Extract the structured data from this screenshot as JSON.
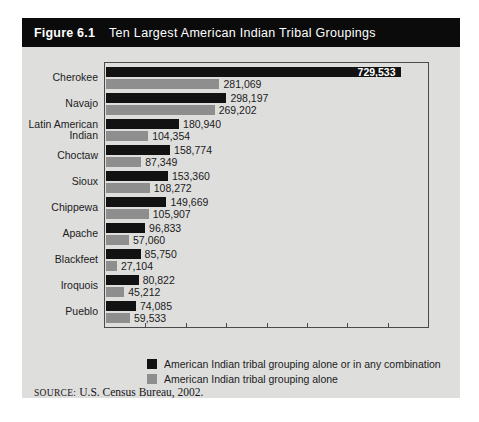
{
  "figure": {
    "number_label": "Figure 6.1",
    "title": "Ten Largest American Indian Tribal Groupings"
  },
  "source": {
    "prefix": "SOURCE:",
    "text": "U.S. Census Bureau, 2002."
  },
  "legend": {
    "position": "bottom",
    "items": [
      {
        "label": "American Indian tribal grouping alone or in any combination",
        "color": "#121212"
      },
      {
        "label": "American Indian tribal grouping alone",
        "color": "#8e8e8e"
      }
    ]
  },
  "colors": {
    "panel_background": "#dededd",
    "title_bar": "#0b0b0b",
    "series_combination": "#121212",
    "series_alone": "#8e8e8e",
    "axis": "#4a4a4a"
  },
  "chart_data": {
    "type": "bar",
    "orientation": "horizontal",
    "title": "Ten Largest American Indian Tribal Groupings",
    "xlabel": "",
    "ylabel": "",
    "xlim": [
      0,
      800000
    ],
    "grid": false,
    "legend_position": "bottom",
    "axis_ticks_labeled": false,
    "tick_count": 8,
    "categories": [
      "Cherokee",
      "Navajo",
      "Latin American\nIndian",
      "Choctaw",
      "Sioux",
      "Chippewa",
      "Apache",
      "Blackfeet",
      "Iroquois",
      "Pueblo"
    ],
    "series": [
      {
        "name": "American Indian tribal grouping alone or in any combination",
        "color": "#121212",
        "values": [
          729533,
          298197,
          180940,
          158774,
          153360,
          149669,
          96833,
          85750,
          80822,
          74085
        ],
        "value_labels": [
          "729,533",
          "298,197",
          "180,940",
          "158,774",
          "153,360",
          "149,669",
          "96,833",
          "85,750",
          "80,822",
          "74,085"
        ]
      },
      {
        "name": "American Indian tribal grouping alone",
        "color": "#8e8e8e",
        "values": [
          281069,
          269202,
          104354,
          87349,
          108272,
          105907,
          57060,
          27104,
          45212,
          59533
        ],
        "value_labels": [
          "281,069",
          "269,202",
          "104,354",
          "87,349",
          "108,272",
          "105,907",
          "57,060",
          "27,104",
          "45,212",
          "59,533"
        ]
      }
    ]
  }
}
